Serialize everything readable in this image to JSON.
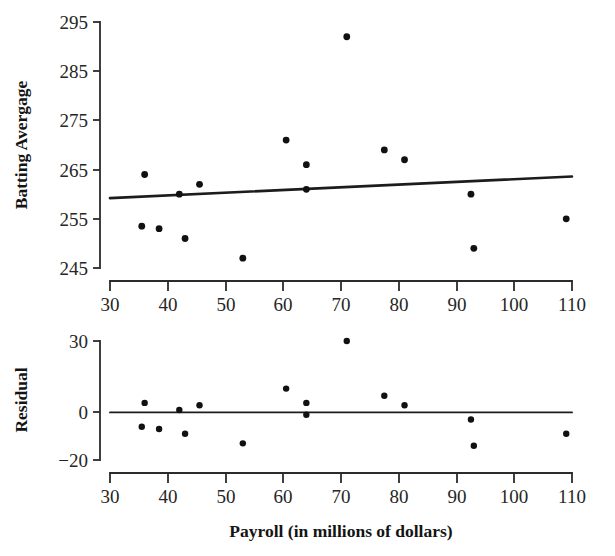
{
  "figure": {
    "caption": "",
    "background_color": "#ffffff",
    "ink_color": "#111111"
  },
  "chart_data": [
    {
      "id": "scatter-batting-average",
      "type": "scatter",
      "title": "",
      "xlabel": "",
      "ylabel": "Batting Avergage",
      "xlim": [
        30,
        110
      ],
      "ylim": [
        245,
        295
      ],
      "xticks": [
        30,
        40,
        50,
        60,
        70,
        80,
        90,
        100,
        110
      ],
      "xticklabels": [
        "30",
        "40",
        "50",
        "60",
        "70",
        "80",
        "90",
        "100",
        "110"
      ],
      "yticks": [
        245,
        255,
        265,
        275,
        285,
        295
      ],
      "yticklabels": [
        "245",
        "255",
        "265",
        "275",
        "285",
        "295"
      ],
      "grid": false,
      "legend": "none",
      "x": [
        35.5,
        36.0,
        38.5,
        42.0,
        43.0,
        45.5,
        53.0,
        60.5,
        64.0,
        64.0,
        71.0,
        77.5,
        81.0,
        92.5,
        93.0,
        109.0
      ],
      "y": [
        253.5,
        264.0,
        253.0,
        260.0,
        251.0,
        262.0,
        247.0,
        271.0,
        266.0,
        261.0,
        292.0,
        269.0,
        267.0,
        260.0,
        249.0,
        255.0
      ],
      "fit_line": {
        "label": "least-squares regression line",
        "x_start": 30,
        "y_start": 259.2,
        "x_end": 110,
        "y_end": 263.6
      }
    },
    {
      "id": "scatter-residuals",
      "type": "scatter",
      "title": "",
      "xlabel": "Payroll (in millions of dollars)",
      "ylabel": "Residual",
      "xlim": [
        30,
        110
      ],
      "ylim": [
        -20,
        30
      ],
      "xticks": [
        30,
        40,
        50,
        60,
        70,
        80,
        90,
        100,
        110
      ],
      "xticklabels": [
        "30",
        "40",
        "50",
        "60",
        "70",
        "80",
        "90",
        "100",
        "110"
      ],
      "yticks": [
        -20,
        0,
        30
      ],
      "yticklabels": [
        "−20",
        "0",
        "30"
      ],
      "grid": false,
      "legend": "none",
      "x": [
        35.5,
        36.0,
        38.5,
        42.0,
        43.0,
        45.5,
        53.0,
        60.5,
        64.0,
        64.0,
        71.0,
        77.5,
        81.0,
        92.5,
        93.0,
        109.0
      ],
      "y": [
        -6.0,
        4.0,
        -7.0,
        1.0,
        -9.0,
        3.0,
        -13.0,
        10.0,
        4.0,
        -1.0,
        30.0,
        7.0,
        3.0,
        -3.0,
        -14.0,
        -9.0
      ],
      "zero_line": {
        "label": "residual zero reference line",
        "x_start": 30,
        "y_start": 0,
        "x_end": 110,
        "y_end": 0
      }
    }
  ]
}
